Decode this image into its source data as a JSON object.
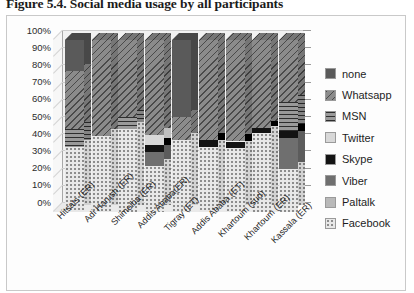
{
  "caption": "Figure 5.4. Social media usage by all participants",
  "chart_data": {
    "type": "bar",
    "subtype": "stacked-percentage-3d",
    "title": "Social media usage by all participants",
    "xlabel": "",
    "ylabel": "",
    "ylim": [
      0,
      100
    ],
    "y_ticks": [
      "0%",
      "10%",
      "20%",
      "30%",
      "40%",
      "50%",
      "60%",
      "70%",
      "80%",
      "90%",
      "100%"
    ],
    "grid": true,
    "legend_position": "right",
    "categories": [
      "Hitsats (ER)",
      "Adi Harush (ER)",
      "Shimelba (ER)",
      "Addis Ababa(ER)",
      "Tigray (ET)",
      "Addis Ababa (ET)",
      "Khartoum (sud)",
      "Khartoum (ER)",
      "Kassala (ER)"
    ],
    "series": [
      {
        "name": "Facebook",
        "pattern": "dotted",
        "color": "#e8e8e8",
        "values": [
          38,
          44,
          48,
          27,
          42,
          38,
          37,
          46,
          25
        ]
      },
      {
        "name": "Paltalk",
        "pattern": "solid-light-gray",
        "color": "#b9b9b9",
        "values": [
          0,
          0,
          0,
          0,
          0,
          0,
          0,
          0,
          0
        ]
      },
      {
        "name": "Viber",
        "pattern": "solid-dark-gray",
        "color": "#6f6f6f",
        "values": [
          0,
          0,
          0,
          8,
          0,
          0,
          0,
          0,
          18
        ]
      },
      {
        "name": "Skype",
        "pattern": "solid-black",
        "color": "#131313",
        "values": [
          0,
          0,
          0,
          4,
          0,
          4,
          4,
          3,
          4
        ]
      },
      {
        "name": "Twitter",
        "pattern": "solid-pale-gray",
        "color": "#d8d8d8",
        "values": [
          0,
          0,
          0,
          6,
          0,
          0,
          0,
          0,
          0
        ]
      },
      {
        "name": "MSN",
        "pattern": "horizontal-lines",
        "color": "#9a9a9a",
        "values": [
          10,
          0,
          7,
          0,
          0,
          0,
          0,
          0,
          17
        ]
      },
      {
        "name": "Whatsapp",
        "pattern": "diagonal-stripes",
        "color": "#8b8b8b",
        "values": [
          34,
          56,
          45,
          55,
          13,
          58,
          59,
          51,
          36
        ]
      },
      {
        "name": "none",
        "pattern": "solid-mid-gray",
        "color": "#5a5a5a",
        "values": [
          18,
          0,
          0,
          0,
          45,
          0,
          0,
          0,
          0
        ]
      }
    ]
  },
  "legend": {
    "items": [
      {
        "label": "none",
        "swatch_class": "p-none"
      },
      {
        "label": "Whatsapp",
        "swatch_class": "p-whatsapp"
      },
      {
        "label": "MSN",
        "swatch_class": "p-msn"
      },
      {
        "label": "Twitter",
        "swatch_class": "p-twitter"
      },
      {
        "label": "Skype",
        "swatch_class": "p-skype"
      },
      {
        "label": "Viber",
        "swatch_class": "p-viber"
      },
      {
        "label": "Paltalk",
        "swatch_class": "p-paltalk"
      },
      {
        "label": "Facebook",
        "swatch_class": "p-facebook"
      }
    ]
  }
}
